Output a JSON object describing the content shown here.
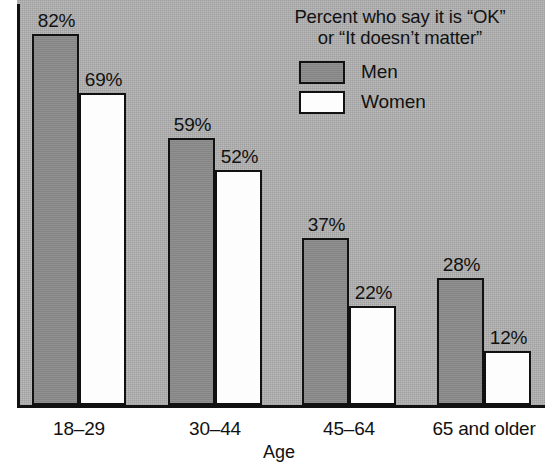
{
  "chart_data": {
    "type": "bar",
    "title": "",
    "legend_title_lines": [
      "Percent who say it is “OK”",
      "or “It doesn’t matter”"
    ],
    "xlabel": "Age",
    "ylabel": "",
    "ylim": [
      0,
      90
    ],
    "grid": false,
    "legend_position": "top-right",
    "categories": [
      "18–29",
      "30–44",
      "45–64",
      "65 and older"
    ],
    "series": [
      {
        "name": "Men",
        "color": "#8b8b8b",
        "values": [
          82,
          59,
          37,
          28
        ],
        "labels": [
          "82%",
          "59%",
          "37%",
          "28%"
        ]
      },
      {
        "name": "Women",
        "color": "#fdfdfd",
        "values": [
          69,
          52,
          22,
          12
        ],
        "labels": [
          "69%",
          "52%",
          "22%",
          "12%"
        ]
      }
    ]
  },
  "legend": {
    "title_line1": "Percent who say it is “OK”",
    "title_line2": "or “It doesn’t matter”",
    "items": [
      {
        "label": "Men"
      },
      {
        "label": "Women"
      }
    ]
  },
  "axis": {
    "x_title": "Age",
    "categories": [
      "18–29",
      "30–44",
      "45–64",
      "65 and older"
    ]
  },
  "bars": [
    {
      "label": "82%",
      "value": 82,
      "series": "Men",
      "category": "18–29"
    },
    {
      "label": "69%",
      "value": 69,
      "series": "Women",
      "category": "18–29"
    },
    {
      "label": "59%",
      "value": 59,
      "series": "Men",
      "category": "30–44"
    },
    {
      "label": "52%",
      "value": 52,
      "series": "Women",
      "category": "30–44"
    },
    {
      "label": "37%",
      "value": 37,
      "series": "Men",
      "category": "45–64"
    },
    {
      "label": "22%",
      "value": 22,
      "series": "Women",
      "category": "45–64"
    },
    {
      "label": "28%",
      "value": 28,
      "series": "Men",
      "category": "65 and older"
    },
    {
      "label": "12%",
      "value": 12,
      "series": "Women",
      "category": "65 and older"
    }
  ],
  "colors": {
    "plot_background": "#b2b2b2",
    "men_bar": "#8b8b8b",
    "women_bar": "#fdfdfd",
    "outline": "#111111",
    "page_background": "#ffffff"
  }
}
